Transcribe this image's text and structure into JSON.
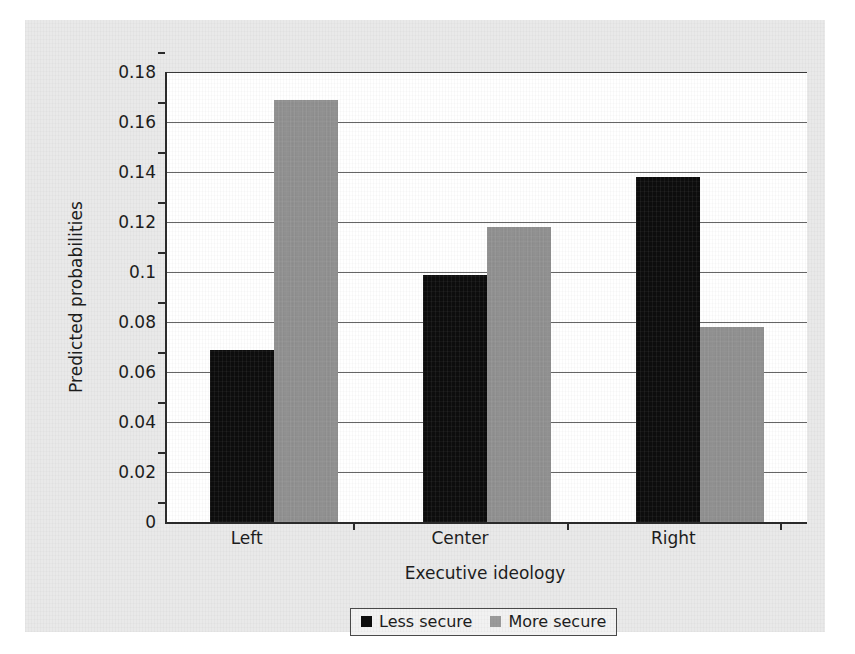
{
  "chart_data": {
    "type": "bar",
    "title": "",
    "xlabel": "Executive ideology",
    "ylabel": "Predicted probabilities",
    "categories": [
      "Left",
      "Center",
      "Right"
    ],
    "series": [
      {
        "name": "Less secure",
        "color": "#0d0d0d",
        "values": [
          0.069,
          0.099,
          0.138
        ]
      },
      {
        "name": "More secure",
        "color": "#909090",
        "values": [
          0.169,
          0.118,
          0.078
        ]
      }
    ],
    "ylim": [
      0,
      0.18
    ],
    "ytick_labels": [
      "0.18",
      "0.16",
      "0.14",
      "0.12",
      "0.1",
      "0.08",
      "0.06",
      "0.04",
      "0.02",
      "0"
    ],
    "ytick_values": [
      0.18,
      0.16,
      0.14,
      0.12,
      0.1,
      0.08,
      0.06,
      0.04,
      0.02,
      0
    ],
    "grid": true,
    "legend_position": "bottom"
  },
  "axes": {
    "y_title": "Predicted probabilities",
    "x_title": "Executive ideology"
  },
  "legend": {
    "items": [
      {
        "label": "Less secure",
        "swatch": "black-square-swatch"
      },
      {
        "label": "More secure",
        "swatch": "gray-square-swatch"
      }
    ]
  },
  "colors": {
    "figure_background": "#e9e9e9",
    "plot_background": "#ffffff",
    "axis": "#2b2b2b",
    "gridline": "#666666",
    "less_secure": "#0d0d0d",
    "more_secure": "#909090"
  }
}
